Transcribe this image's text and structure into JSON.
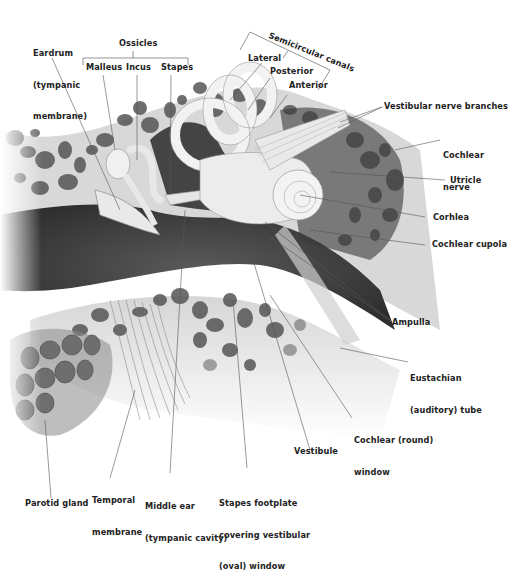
{
  "figure": {
    "colors": {
      "bone": "#d9d9d9",
      "bone_pores": "#555555",
      "canal": "#3a3a3a",
      "structures": "#efefef",
      "label_text": "#222222",
      "leader_line": "#555555"
    }
  },
  "labels": {
    "eardrum": {
      "line1": "Eardrum",
      "line2": "(tympanic",
      "line3": "membrane)"
    },
    "ossicles": {
      "group": "Ossicles",
      "malleus": "Malleus",
      "incus": "Incus",
      "stapes": "Stapes"
    },
    "semicircular": {
      "group": "Semicircular canals",
      "lateral": "Lateral",
      "posterior": "Posterior",
      "anterior": "Anterior"
    },
    "vestibular_nerve_branches": "Vestibular nerve branches",
    "cochlear_nerve": {
      "line1": "Cochlear",
      "line2": "nerve"
    },
    "utricle": "Utricle",
    "cochlea": "Corhlea",
    "cochlear_cupola": "Cochlear cupola",
    "ampulla": "Ampulla",
    "eustachian_tube": {
      "line1": "Eustachian",
      "line2": "(auditory) tube"
    },
    "cochlear_round_window": {
      "line1": "Cochlear (round)",
      "line2": "window"
    },
    "vestibule": "Vestibule",
    "stapes_footplate": {
      "line1": "Stapes footplate",
      "line2": "covering vestibular",
      "line3": "(oval) window"
    },
    "middle_ear": {
      "line1": "Middle ear",
      "line2": "(tympanic cavity)"
    },
    "temporal_membrane": {
      "line1": "Temporal",
      "line2": "membrane"
    },
    "parotid_gland": "Parotid gland"
  }
}
